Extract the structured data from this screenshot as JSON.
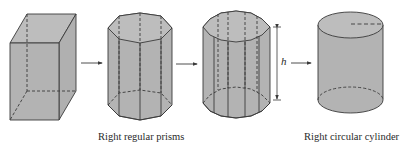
{
  "figure": {
    "captions": {
      "prisms": "Right regular prisms",
      "cylinder": "Right circular cylinder"
    },
    "height_label": "h",
    "shapes": [
      {
        "name": "rectangular prism",
        "sides": 4
      },
      {
        "name": "octagonal prism",
        "sides": 8
      },
      {
        "name": "many-sided prism",
        "sides": 12
      },
      {
        "name": "circular cylinder",
        "sides": "infinite"
      }
    ],
    "colors": {
      "fill": "#b3b3b3",
      "fill_top": "#bdbdbd",
      "stroke": "#3a3a3a",
      "background": "#ffffff"
    }
  }
}
